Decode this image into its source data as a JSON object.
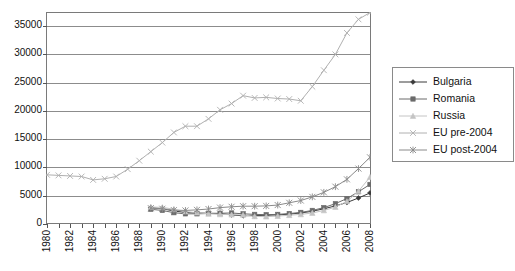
{
  "chart_data": {
    "type": "line",
    "title": "",
    "xlabel": "",
    "ylabel": "",
    "x": [
      1980,
      1981,
      1982,
      1983,
      1984,
      1985,
      1986,
      1987,
      1988,
      1989,
      1990,
      1991,
      1992,
      1993,
      1994,
      1995,
      1996,
      1997,
      1998,
      1999,
      2000,
      2001,
      2002,
      2003,
      2004,
      2005,
      2006,
      2007,
      2008
    ],
    "xlim": [
      1980,
      2008
    ],
    "ylim": [
      0,
      37500
    ],
    "yticks": [
      0,
      5000,
      10000,
      15000,
      20000,
      25000,
      30000,
      35000
    ],
    "xticks_labeled": [
      1980,
      1982,
      1984,
      1986,
      1988,
      1990,
      1992,
      1994,
      1996,
      1998,
      2000,
      2002,
      2004,
      2006,
      2008
    ],
    "grid": true,
    "legend_position": "right",
    "series": [
      {
        "name": "Bulgaria",
        "color": "#3a3a3a",
        "marker": "diamond",
        "x": [
          1989,
          1990,
          1991,
          1992,
          1993,
          1994,
          1995,
          1996,
          1997,
          1998,
          1999,
          2000,
          2001,
          2002,
          2003,
          2004,
          2005,
          2006,
          2007,
          2008
        ],
        "values": [
          2900,
          2700,
          2300,
          2050,
          1950,
          1900,
          1850,
          1600,
          1450,
          1500,
          1550,
          1600,
          1750,
          1950,
          2250,
          2700,
          3200,
          3800,
          4600,
          5500
        ]
      },
      {
        "name": "Romania",
        "color": "#6b6b6b",
        "marker": "square",
        "x": [
          1989,
          1990,
          1991,
          1992,
          1993,
          1994,
          1995,
          1996,
          1997,
          1998,
          1999,
          2000,
          2001,
          2002,
          2003,
          2004,
          2005,
          2006,
          2007,
          2008
        ],
        "values": [
          2600,
          2400,
          2000,
          1800,
          1800,
          1850,
          1900,
          1950,
          1800,
          1700,
          1650,
          1700,
          1850,
          2050,
          2400,
          2900,
          3600,
          4500,
          5700,
          7000
        ]
      },
      {
        "name": "Russia",
        "color": "#c4c4c4",
        "marker": "triangle",
        "x": [
          1989,
          1990,
          1991,
          1992,
          1993,
          1994,
          1995,
          1996,
          1997,
          1998,
          1999,
          2000,
          2001,
          2002,
          2003,
          2004,
          2005,
          2006,
          2007,
          2008
        ],
        "values": [
          3000,
          2950,
          2600,
          2200,
          2000,
          1800,
          1700,
          1650,
          1600,
          1350,
          1300,
          1400,
          1550,
          1700,
          1950,
          2400,
          3000,
          4000,
          5800,
          8300
        ]
      },
      {
        "name": "EU pre-2004",
        "color": "#b0b0b0",
        "marker": "cross",
        "x": [
          1980,
          1981,
          1982,
          1983,
          1984,
          1985,
          1986,
          1987,
          1988,
          1989,
          1990,
          1991,
          1992,
          1993,
          1994,
          1995,
          1996,
          1997,
          1998,
          1999,
          2000,
          2001,
          2002,
          2003,
          2004,
          2005,
          2006,
          2007,
          2008
        ],
        "values": [
          8700,
          8600,
          8500,
          8400,
          7800,
          8000,
          8400,
          9700,
          11200,
          12800,
          14400,
          16200,
          17300,
          17300,
          18600,
          20200,
          21300,
          22700,
          22300,
          22400,
          22200,
          22100,
          21800,
          24300,
          27200,
          30000,
          33800,
          36200,
          37400
        ]
      },
      {
        "name": "EU post-2004",
        "color": "#8a8a8a",
        "marker": "asterisk",
        "x": [
          1989,
          1990,
          1991,
          1992,
          1993,
          1994,
          1995,
          1996,
          1997,
          1998,
          1999,
          2000,
          2001,
          2002,
          2003,
          2004,
          2005,
          2006,
          2007,
          2008
        ],
        "values": [
          2800,
          2700,
          2450,
          2400,
          2500,
          2650,
          2900,
          3050,
          3150,
          3150,
          3200,
          3350,
          3750,
          4150,
          4800,
          5600,
          6600,
          7900,
          9800,
          11800
        ]
      }
    ]
  },
  "legend": {
    "items": [
      {
        "label": "Bulgaria"
      },
      {
        "label": "Romania"
      },
      {
        "label": "Russia"
      },
      {
        "label": "EU pre-2004"
      },
      {
        "label": "EU post-2004"
      }
    ]
  }
}
